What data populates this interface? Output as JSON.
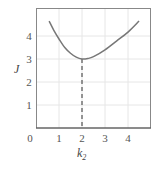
{
  "chart_data": {
    "type": "line",
    "title": "",
    "xlabel": "k2",
    "xlabel_main": "k",
    "xlabel_sub": "2",
    "ylabel": "J",
    "xlim": [
      0,
      5
    ],
    "ylim": [
      0,
      5.2
    ],
    "x_ticks": [
      "0",
      "1",
      "2",
      "3",
      "4"
    ],
    "y_ticks": [
      "1",
      "2",
      "3",
      "4"
    ],
    "grid": true,
    "legend": null,
    "series": [
      {
        "name": "J(k2)",
        "x": [
          0.57,
          0.8,
          1.0,
          1.25,
          1.5,
          1.75,
          2.0,
          2.25,
          2.5,
          3.0,
          3.5,
          4.0,
          4.48
        ],
        "y": [
          4.65,
          4.2,
          3.87,
          3.5,
          3.25,
          3.08,
          3.0,
          3.02,
          3.1,
          3.4,
          3.78,
          4.17,
          4.65
        ]
      }
    ],
    "annotations": [
      {
        "type": "dashed-vline",
        "x": 2.0,
        "y_from": 0,
        "y_to": 3.0,
        "label": "minimum at k2 = 2, J = 3"
      }
    ]
  }
}
